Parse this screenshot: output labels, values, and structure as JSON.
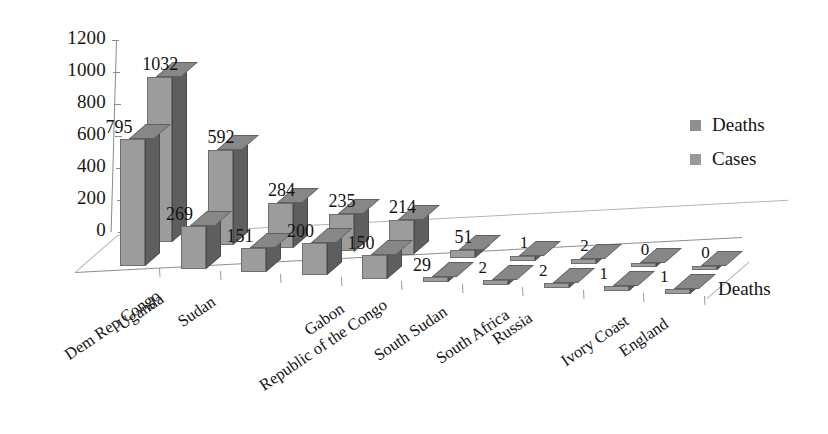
{
  "chart_data": {
    "type": "bar",
    "title": "",
    "subtitle": "",
    "xlabel": "",
    "ylabel": "",
    "depth_axis_label": "Deaths",
    "categories": [
      "Dem Rep Congo",
      "Uganda",
      "Sudan",
      "Republic of the Congo",
      "Gabon",
      "South Sudan",
      "South Africa",
      "Russia",
      "Ivory Coast",
      "England"
    ],
    "series": [
      {
        "name": "Deaths",
        "values": [
          795,
          269,
          151,
          200,
          150,
          29,
          2,
          2,
          1,
          1
        ]
      },
      {
        "name": "Cases",
        "values": [
          1032,
          592,
          284,
          235,
          214,
          51,
          1,
          2,
          0,
          0
        ]
      }
    ],
    "ylim": [
      0,
      1200
    ],
    "yticks": [
      "1200",
      "1000",
      "800",
      "600",
      "400",
      "200",
      "0"
    ],
    "grid": false,
    "legend_position": "right",
    "three_d": true,
    "colors": {
      "deaths": "#9c9c9c",
      "cases": "#9c9c9c",
      "bar_side": "#5e5e5e",
      "bar_top": "#878787",
      "axis": "#8e8e8e",
      "background": "#ffffff",
      "text": "#131313"
    }
  },
  "legend": {
    "items": [
      {
        "label": "Deaths",
        "color": "#8f8f8f"
      },
      {
        "label": "Cases",
        "color": "#9a9a9a"
      }
    ]
  },
  "axis": {
    "y_ticks": [
      "1200",
      "1000",
      "800",
      "600",
      "400",
      "200",
      "0"
    ],
    "depth_label": "Deaths"
  },
  "categories": [
    "Dem Rep Congo",
    "Uganda",
    "Sudan",
    "Republic of the Congo",
    "Gabon",
    "South Sudan",
    "South Africa",
    "Russia",
    "Ivory Coast",
    "England"
  ],
  "labels": {
    "deaths": [
      "795",
      "269",
      "151",
      "200",
      "150",
      "29",
      "2",
      "2",
      "1",
      "1"
    ],
    "cases": [
      "1032",
      "592",
      "284",
      "235",
      "214",
      "51",
      "1",
      "2",
      "0",
      "0"
    ]
  }
}
